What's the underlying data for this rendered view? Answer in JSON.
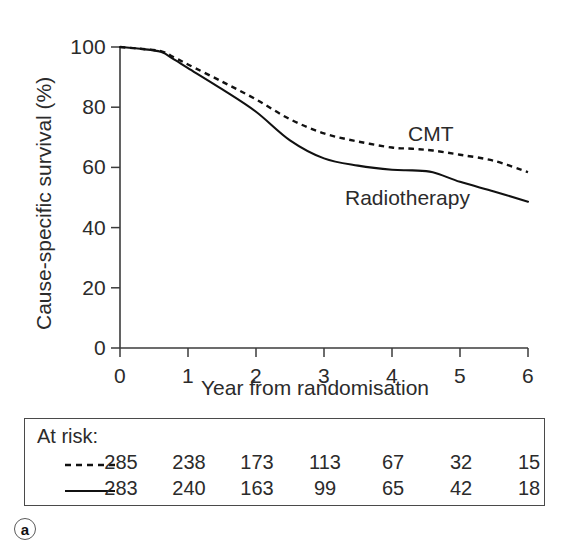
{
  "chart_data": {
    "type": "line",
    "title": "",
    "xlabel": "Year from randomisation",
    "ylabel": "Cause-specific survival (%)",
    "xlim": [
      0,
      6
    ],
    "ylim": [
      0,
      100
    ],
    "xticks": [
      "0",
      "1",
      "2",
      "3",
      "4",
      "5",
      "6"
    ],
    "yticks": [
      "0",
      "20",
      "40",
      "60",
      "80",
      "100"
    ],
    "grid": false,
    "legend_position": "inline-annotation",
    "series": [
      {
        "name": "CMT",
        "style": "dashed",
        "color": "#111111",
        "annotation": "CMT",
        "x": [
          0,
          0.3,
          0.6,
          0.8,
          1.0,
          1.5,
          2.0,
          2.5,
          3.0,
          3.5,
          4.0,
          4.3,
          4.6,
          5.0,
          5.5,
          6.0
        ],
        "y": [
          100,
          99.4,
          98.6,
          96.5,
          94.2,
          88.5,
          82.6,
          76.0,
          71.3,
          68.6,
          66.6,
          66.2,
          65.6,
          64.2,
          62.2,
          58.4
        ]
      },
      {
        "name": "Radiotherapy",
        "style": "solid",
        "color": "#111111",
        "annotation": "Radiotherapy",
        "x": [
          0,
          0.3,
          0.6,
          0.8,
          1.0,
          1.5,
          2.0,
          2.5,
          3.0,
          3.5,
          4.0,
          4.3,
          4.6,
          5.0,
          5.5,
          6.0
        ],
        "y": [
          100,
          99.4,
          98.4,
          95.8,
          93.0,
          86.0,
          78.5,
          69.0,
          63.0,
          60.6,
          59.2,
          59.0,
          58.4,
          55.2,
          52.0,
          48.6
        ]
      }
    ]
  },
  "annotations": {
    "cmt": "CMT",
    "radiotherapy": "Radiotherapy"
  },
  "at_risk": {
    "title": "At risk:",
    "rows": [
      {
        "key_style": "dashed",
        "series": "CMT",
        "values": [
          "285",
          "238",
          "173",
          "113",
          "67",
          "32",
          "15"
        ]
      },
      {
        "key_style": "solid",
        "series": "Radiotherapy",
        "values": [
          "283",
          "240",
          "163",
          "99",
          "65",
          "42",
          "18"
        ]
      }
    ]
  },
  "panel": {
    "label": "a"
  }
}
